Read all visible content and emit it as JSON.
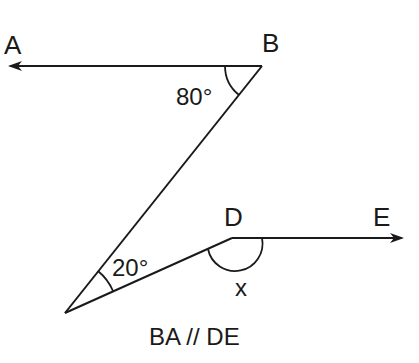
{
  "diagram": {
    "type": "geometry",
    "points": {
      "A": {
        "label": "A"
      },
      "B": {
        "label": "B"
      },
      "D": {
        "label": "D"
      },
      "E": {
        "label": "E"
      }
    },
    "angles": {
      "at_B": "80°",
      "at_bottom_vertex": "20°",
      "at_D": "x"
    },
    "caption": "BA // DE",
    "colors": {
      "stroke": "#1a1a1a",
      "background": "#ffffff"
    }
  }
}
